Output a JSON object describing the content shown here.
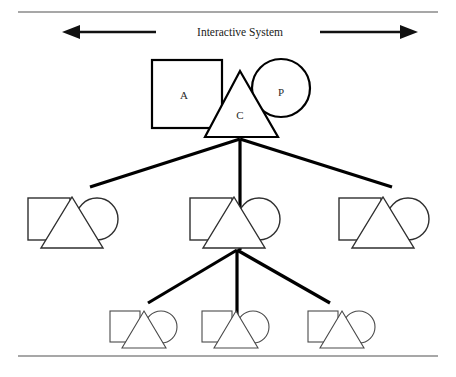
{
  "figure": {
    "caption": "Interactive System",
    "background_color": "#ffffff",
    "frame": {
      "top_rule_color": "#8a8a8a",
      "bottom_rule_color": "#8a8a8a",
      "top_rule_y": 12,
      "bottom_rule_y": 356
    },
    "arrows": {
      "left": {
        "name": "left-arrow",
        "direction": "left",
        "color": "#111111",
        "x_start": 156,
        "x_end": 62,
        "y": 32
      },
      "right": {
        "name": "right-arrow",
        "direction": "right",
        "color": "#111111",
        "x_start": 320,
        "x_end": 418,
        "y": 32
      }
    },
    "node_legend": {
      "square_label": "A",
      "triangle_label": "C",
      "circle_label": "P"
    },
    "levels": [
      {
        "level": 1,
        "name": "root-level",
        "nodes": [
          {
            "id": "root",
            "labeled": true,
            "square": {
              "x": 152,
              "y": 60,
              "w": 70,
              "h": 68,
              "label": "A",
              "label_x": 184,
              "label_y": 99
            },
            "circle": {
              "cx": 281,
              "cy": 88,
              "r": 29,
              "label": "P",
              "label_x": 281,
              "label_y": 96
            },
            "triangle": {
              "apex_x": 240,
              "apex_y": 71,
              "left_x": 205,
              "right_x": 278,
              "base_y": 137,
              "label": "C",
              "label_y": 119
            }
          }
        ]
      },
      {
        "level": 2,
        "name": "middle-level",
        "nodes": [
          {
            "id": "mid-left",
            "cx": 72,
            "labeled": false
          },
          {
            "id": "mid-center",
            "cx": 234,
            "labeled": false
          },
          {
            "id": "mid-right",
            "cx": 383,
            "labeled": false
          }
        ],
        "square": {
          "w": 41,
          "h": 41,
          "dx": -38,
          "y": 198
        },
        "circle": {
          "r": 21,
          "dx": 24,
          "cy": 219
        },
        "triangle": {
          "apex_dx": 0,
          "apex_y": 197,
          "half_width": 31,
          "base_y": 248
        }
      },
      {
        "level": 3,
        "name": "leaf-level",
        "nodes": [
          {
            "id": "leaf-left",
            "cx": 144,
            "labeled": false
          },
          {
            "id": "leaf-center",
            "cx": 236,
            "labeled": false
          },
          {
            "id": "leaf-right",
            "cx": 342,
            "labeled": false
          }
        ],
        "square": {
          "w": 28,
          "h": 28,
          "dx": -27,
          "y": 311
        },
        "circle": {
          "r": 15,
          "dx": 16,
          "cy": 327
        },
        "triangle": {
          "apex_y": 311,
          "half_width": 22,
          "base_y": 348
        }
      }
    ],
    "connectors": [
      {
        "name": "root-to-mid-left",
        "x1": 240,
        "y1": 139,
        "x2": 90,
        "y2": 187
      },
      {
        "name": "root-to-mid-center",
        "x1": 240,
        "y1": 139,
        "x2": 240,
        "y2": 250
      },
      {
        "name": "root-to-mid-right",
        "x1": 240,
        "y1": 139,
        "x2": 392,
        "y2": 187
      },
      {
        "name": "mid-to-leaf-left",
        "x1": 237,
        "y1": 250,
        "x2": 148,
        "y2": 303
      },
      {
        "name": "mid-to-leaf-center",
        "x1": 237,
        "y1": 250,
        "x2": 237,
        "y2": 348
      },
      {
        "name": "mid-to-leaf-right",
        "x1": 237,
        "y1": 250,
        "x2": 330,
        "y2": 303
      }
    ]
  }
}
